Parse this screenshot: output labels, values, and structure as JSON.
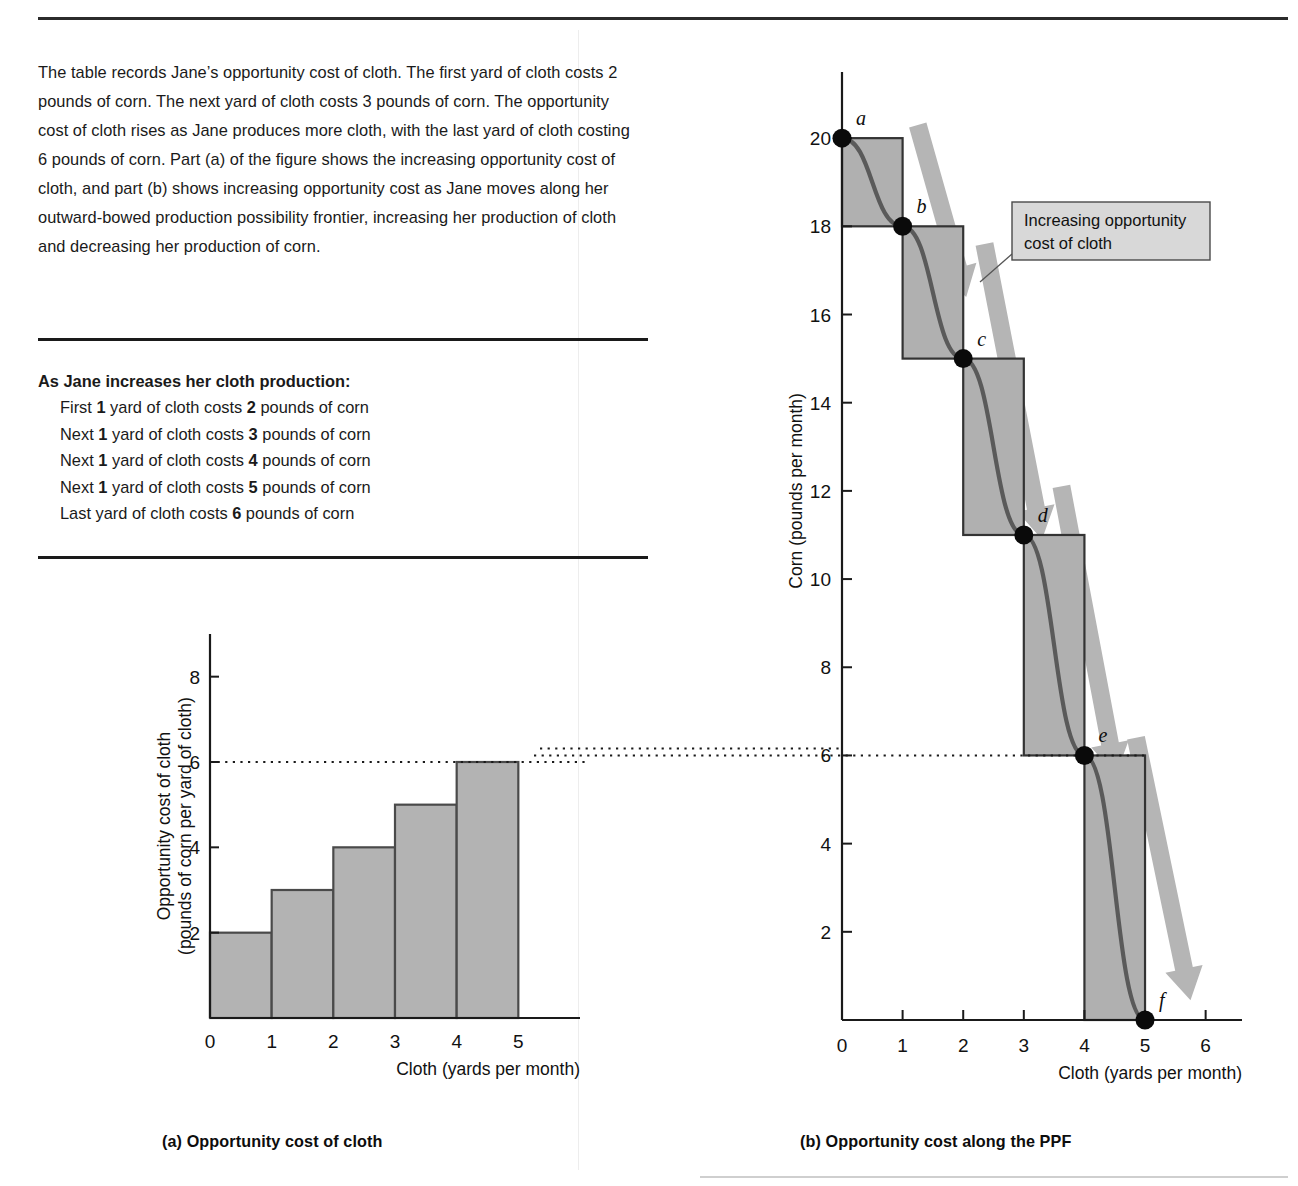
{
  "intro": {
    "text": "The table records Jane’s opportunity cost of cloth. The first yard of cloth costs 2 pounds of corn. The next yard of cloth costs 3 pounds of corn. The opportunity cost of cloth rises as Jane produces more cloth, with the last yard of cloth costing 6 pounds of corn. Part (a) of the figure shows the increasing opportunity cost of cloth, and part (b) shows increasing opportunity cost as Jane moves along her outward-bowed production possibility frontier, increasing her production of cloth and decreasing her production of corn."
  },
  "table": {
    "heading": "As Jane increases her cloth production:",
    "rows": [
      {
        "prefix": "First",
        "qty": "1",
        "mid": "yard of cloth costs",
        "cost": "2",
        "suffix": "pounds of corn"
      },
      {
        "prefix": "Next",
        "qty": "1",
        "mid": "yard of cloth costs",
        "cost": "3",
        "suffix": "pounds of corn"
      },
      {
        "prefix": "Next",
        "qty": "1",
        "mid": "yard of cloth costs",
        "cost": "4",
        "suffix": "pounds of corn"
      },
      {
        "prefix": "Next",
        "qty": "1",
        "mid": "yard of cloth costs",
        "cost": "5",
        "suffix": "pounds of corn"
      },
      {
        "prefix": "Last",
        "qty": "",
        "mid": "yard of cloth costs",
        "cost": "6",
        "suffix": "pounds of corn"
      }
    ]
  },
  "captions": {
    "a": "(a) Opportunity cost of cloth",
    "b": "(b) Opportunity cost along the PPF"
  },
  "callout": {
    "line1": "Increasing opportunity",
    "line2": "cost of cloth"
  },
  "colors": {
    "bar_fill": "#b3b3b3",
    "bar_stroke": "#4a4a4a",
    "step_fill": "#b0b0b0",
    "ppf_line": "#5a5a5a",
    "arrow": "#b5b5b5",
    "callout_fill": "#d8d8d8",
    "axis": "#1a1a1a"
  },
  "chart_data": [
    {
      "type": "bar",
      "id": "opportunity-cost-of-cloth",
      "title": "(a) Opportunity cost of cloth",
      "xlabel": "Cloth (yards per month)",
      "ylabel_line1": "Opportunity cost of cloth",
      "ylabel_line2": "(pounds of corn per yard of cloth)",
      "categories": [
        "1",
        "2",
        "3",
        "4",
        "5"
      ],
      "bar_spans": [
        [
          0,
          1
        ],
        [
          1,
          2
        ],
        [
          2,
          3
        ],
        [
          3,
          4
        ],
        [
          4,
          5
        ]
      ],
      "values": [
        2,
        3,
        4,
        5,
        6
      ],
      "xticks": [
        0,
        1,
        2,
        3,
        4,
        5
      ],
      "yticks": [
        2,
        4,
        6,
        8
      ],
      "xlim": [
        0,
        6
      ],
      "ylim": [
        0,
        9
      ],
      "grid": false,
      "reference_line": {
        "y": 6,
        "style": "dotted"
      },
      "legend": "none"
    },
    {
      "type": "line",
      "id": "opportunity-cost-along-the-ppf",
      "title": "(b) Opportunity cost along the PPF",
      "xlabel": "Cloth (yards per month)",
      "ylabel": "Corn (pounds per month)",
      "xticks": [
        0,
        1,
        2,
        3,
        4,
        5,
        6
      ],
      "yticks": [
        2,
        4,
        6,
        8,
        10,
        12,
        14,
        16,
        18,
        20
      ],
      "xlim": [
        0,
        6.6
      ],
      "ylim": [
        0,
        21.5
      ],
      "grid": false,
      "legend": "none",
      "series": [
        {
          "name": "Production possibility frontier",
          "x": [
            0,
            1,
            2,
            3,
            4,
            5
          ],
          "y": [
            20,
            18,
            15,
            11,
            6,
            0
          ]
        }
      ],
      "points": [
        {
          "label": "a",
          "x": 0,
          "y": 20
        },
        {
          "label": "b",
          "x": 1,
          "y": 18
        },
        {
          "label": "c",
          "x": 2,
          "y": 15
        },
        {
          "label": "d",
          "x": 3,
          "y": 11
        },
        {
          "label": "e",
          "x": 4,
          "y": 6
        },
        {
          "label": "f",
          "x": 5,
          "y": 0
        }
      ],
      "step_rectangles": [
        {
          "x0": 0,
          "x1": 1,
          "y0": 18,
          "y1": 20,
          "cost": 2
        },
        {
          "x0": 1,
          "x1": 2,
          "y0": 15,
          "y1": 18,
          "cost": 3
        },
        {
          "x0": 2,
          "x1": 3,
          "y0": 11,
          "y1": 15,
          "cost": 4
        },
        {
          "x0": 3,
          "x1": 4,
          "y0": 6,
          "y1": 11,
          "cost": 5
        },
        {
          "x0": 4,
          "x1": 5,
          "y0": 0,
          "y1": 6,
          "cost": 6
        }
      ],
      "reference_line": {
        "y": 6,
        "style": "dotted"
      },
      "annotations": [
        {
          "text": "Increasing opportunity cost of cloth",
          "kind": "callout"
        }
      ]
    }
  ]
}
